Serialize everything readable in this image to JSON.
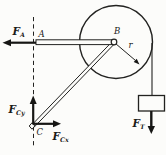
{
  "figure": {
    "background_color": "#fcfcfa",
    "ink_color": "#222220",
    "point_labels": {
      "a": "A",
      "b": "B",
      "c": "C"
    },
    "radius_label": "r",
    "forces": {
      "fa": {
        "symbol": "F",
        "subscript": "A"
      },
      "fcy": {
        "symbol": "F",
        "subscript": "Cy"
      },
      "fcx": {
        "symbol": "F",
        "subscript": "Cx"
      },
      "ft": {
        "symbol": "F",
        "subscript": "T"
      }
    }
  }
}
